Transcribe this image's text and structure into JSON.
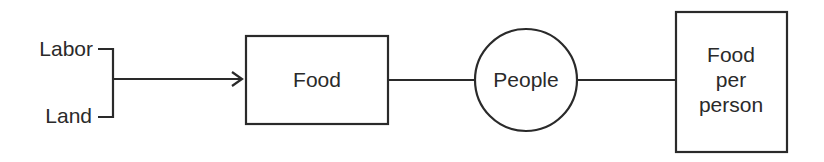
{
  "diagram": {
    "inputs": [
      {
        "id": "labor",
        "label": "Labor"
      },
      {
        "id": "land",
        "label": "Land"
      }
    ],
    "nodes": [
      {
        "id": "food",
        "shape": "rectangle",
        "label": "Food"
      },
      {
        "id": "people",
        "shape": "circle",
        "label": "People"
      },
      {
        "id": "food_per_person",
        "shape": "rectangle",
        "label_lines": [
          "Food",
          "per",
          "person"
        ]
      }
    ],
    "edges": [
      {
        "from": [
          "labor",
          "land"
        ],
        "to": "food",
        "type": "arrow"
      },
      {
        "from": "food",
        "to": "people",
        "type": "line"
      },
      {
        "from": "people",
        "to": "food_per_person",
        "type": "line"
      }
    ],
    "colors": {
      "stroke": "#2a2a2a",
      "background": "#ffffff"
    }
  }
}
